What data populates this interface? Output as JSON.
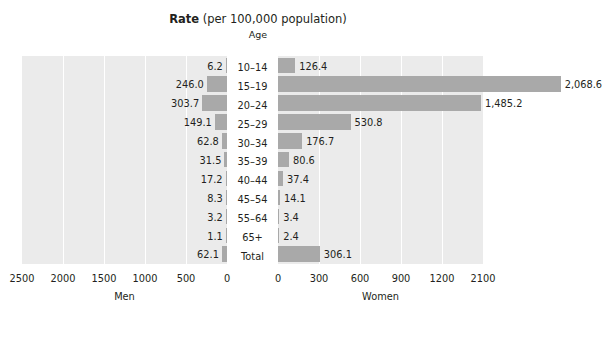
{
  "title": {
    "emphasis": "Rate",
    "rest": " (per 100,000 population)",
    "age_header": "Age"
  },
  "colors": {
    "bar": "#a9a9a9",
    "panel_background": "#ebebeb",
    "gridline": "#ffffff",
    "text": "#231f20"
  },
  "chart_data": {
    "type": "bar",
    "orientation": "horizontal",
    "layout": "population-pyramid-two-panel",
    "title": "Rate (per 100,000 population)",
    "xlabel": "",
    "ylabel": "Age",
    "grid": true,
    "legend_position": "none",
    "categories": [
      "10–14",
      "15–19",
      "20–24",
      "25–29",
      "30–34",
      "35–39",
      "40–44",
      "45–54",
      "55–64",
      "65+",
      "Total"
    ],
    "series": [
      {
        "name": "Men",
        "direction": "left",
        "axis_label": "Men",
        "axis_ticks": [
          "2500",
          "2000",
          "1500",
          "1000",
          "500",
          "0"
        ],
        "axis_tick_values": [
          2500,
          2000,
          1500,
          1000,
          500,
          0
        ],
        "xlim": [
          0,
          2500
        ],
        "values": [
          6.2,
          246.0,
          303.7,
          149.1,
          62.8,
          31.5,
          17.2,
          8.3,
          3.2,
          1.1,
          62.1
        ],
        "value_labels": [
          "6.2",
          "246.0",
          "303.7",
          "149.1",
          "62.8",
          "31.5",
          "17.2",
          "8.3",
          "3.2",
          "1.1",
          "62.1"
        ]
      },
      {
        "name": "Women",
        "direction": "right",
        "axis_label": "Women",
        "axis_ticks": [
          "0",
          "300",
          "600",
          "900",
          "1200",
          "2100"
        ],
        "axis_tick_values": [
          0,
          300,
          600,
          900,
          1200,
          1500
        ],
        "xlim": [
          0,
          1500
        ],
        "values": [
          126.4,
          2068.6,
          1485.2,
          530.8,
          176.7,
          80.6,
          37.4,
          14.1,
          3.4,
          2.4,
          306.1
        ],
        "value_labels": [
          "126.4",
          "2,068.6",
          "1,485.2",
          "530.8",
          "176.7",
          "80.6",
          "37.4",
          "14.1",
          "3.4",
          "2.4",
          "306.1"
        ]
      }
    ]
  }
}
